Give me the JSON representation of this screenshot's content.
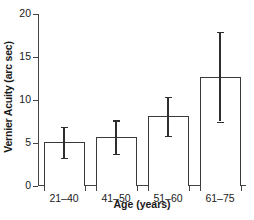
{
  "chart_data": {
    "type": "bar",
    "title": "",
    "xlabel": "Age (years)",
    "ylabel": "Vernier Acuity (arc sec)",
    "categories": [
      "21–40",
      "41–50",
      "51–60",
      "61–75"
    ],
    "values": [
      5.1,
      5.7,
      8.1,
      12.7
    ],
    "errors": [
      1.8,
      1.95,
      2.3,
      5.2
    ],
    "error_low": [
      3.3,
      3.75,
      5.8,
      7.5
    ],
    "error_high": [
      6.9,
      7.65,
      10.4,
      17.9
    ],
    "ylim": [
      0,
      20
    ],
    "yticks": [
      0,
      5,
      10,
      15,
      20
    ],
    "ytick_labels": [
      "0",
      "5",
      "10",
      "15",
      "20"
    ],
    "grid": false,
    "legend": false,
    "bar_fill": "#ffffff",
    "bar_edge": "#3a3a3a",
    "error_color": "#2e2e2e",
    "axis_color": "#444444"
  }
}
